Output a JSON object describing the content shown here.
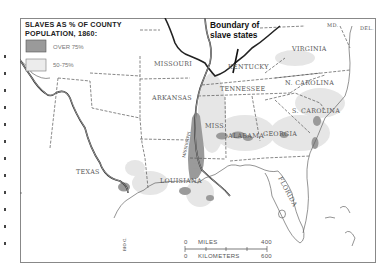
{
  "legend": {
    "title_line1": "SLAVES AS % OF COUNTY",
    "title_line2": "POPULATION, 1860:",
    "items": [
      {
        "label": "OVER 75%",
        "color": "#9a9a9a"
      },
      {
        "label": "50-75%",
        "color": "#e6e6e6"
      }
    ]
  },
  "callout": {
    "line1": "Boundary of",
    "line2": "slave states"
  },
  "states": {
    "missouri": "MISSOURI",
    "kentucky": "KENTUCKY",
    "virginia": "VIRGINIA",
    "arkansas": "ARKANSAS",
    "tennessee": "TENNESSEE",
    "n_carolina": "N. CAROLINA",
    "s_carolina": "S. CAROLINA",
    "miss": "MISS.",
    "alabama": "ALABAMA",
    "georgia": "GEORGIA",
    "texas": "TEXAS",
    "louisiana": "LOUISIANA",
    "florida": "FLORIDA",
    "md": "MD.",
    "del": "DEL."
  },
  "rivers": {
    "mississippi": "MISSISSIPPI",
    "rio_grande": "RIO G."
  },
  "scale": {
    "miles_zero": "0",
    "miles_label": "MILES",
    "miles_max": "400",
    "km_zero": "0",
    "km_label": "KILOMETERS",
    "km_max": "600"
  },
  "colors": {
    "over75": "#9a9a9a",
    "range50_75": "#e6e6e6",
    "border": "#555555",
    "frame": "#777777"
  }
}
